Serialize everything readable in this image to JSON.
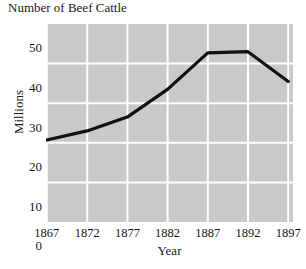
{
  "chart_data": {
    "type": "line",
    "title": "Number of Beef Cattle",
    "xlabel": "Year",
    "ylabel": "Millions",
    "x": [
      1867,
      1872,
      1877,
      1882,
      1887,
      1892,
      1897
    ],
    "categories": [
      "1867",
      "1872",
      "1877",
      "1882",
      "1887",
      "1892",
      "1897"
    ],
    "values": [
      20.7,
      23.0,
      26.5,
      33.5,
      42.7,
      43.0,
      35.5
    ],
    "series": [
      {
        "name": "Number of Beef Cattle",
        "values": [
          20.7,
          23.0,
          26.5,
          33.5,
          42.7,
          43.0,
          35.5
        ]
      }
    ],
    "xlim": [
      1867,
      1897
    ],
    "ylim": [
      0,
      50
    ],
    "yticks": [
      0,
      10,
      20,
      30,
      40,
      50
    ],
    "ytick_labels": [
      "0",
      "10",
      "20",
      "30",
      "40",
      "50"
    ],
    "xticks": [
      1867,
      1872,
      1877,
      1882,
      1887,
      1892,
      1897
    ],
    "xtick_labels": [
      "1867",
      "1872",
      "1877",
      "1882",
      "1887",
      "1892",
      "1897"
    ],
    "grid": true,
    "grid_color": "#ffffff",
    "plot_background": "#c9c9c9",
    "line_color": "#000000",
    "line_width": 3,
    "legend": false,
    "legend_position": "none"
  }
}
